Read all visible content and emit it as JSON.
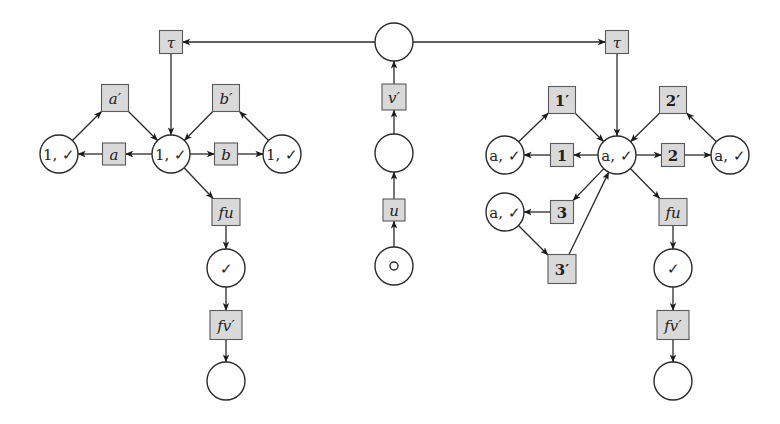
{
  "diagram": {
    "type": "petri-net",
    "colors": {
      "place_stroke": "#2a2a2a",
      "transition_fill": "#d9d9d9",
      "transition_stroke": "#5a5a5a",
      "background": "#ffffff"
    },
    "places": [
      {
        "id": "c_top",
        "x": 394,
        "y": 42,
        "label": ""
      },
      {
        "id": "c_mid",
        "x": 394,
        "y": 153,
        "label": ""
      },
      {
        "id": "c_start",
        "x": 394,
        "y": 266,
        "label": "",
        "token": true
      },
      {
        "id": "L_left",
        "x": 59,
        "y": 154,
        "label": "1, ✓"
      },
      {
        "id": "L_center",
        "x": 171,
        "y": 154,
        "label": "1, ✓"
      },
      {
        "id": "L_right",
        "x": 282,
        "y": 154,
        "label": "1, ✓"
      },
      {
        "id": "L_check",
        "x": 226,
        "y": 268,
        "label": "✓"
      },
      {
        "id": "L_end",
        "x": 226,
        "y": 381,
        "label": ""
      },
      {
        "id": "R_left",
        "x": 505,
        "y": 155,
        "label": "a, ✓"
      },
      {
        "id": "R_center",
        "x": 617,
        "y": 155,
        "label": "a, ✓"
      },
      {
        "id": "R_right",
        "x": 730,
        "y": 155,
        "label": "a, ✓"
      },
      {
        "id": "R_lower",
        "x": 505,
        "y": 212,
        "label": "a, ✓"
      },
      {
        "id": "R_check",
        "x": 673,
        "y": 268,
        "label": "✓"
      },
      {
        "id": "R_end",
        "x": 673,
        "y": 381,
        "label": ""
      }
    ],
    "transitions": [
      {
        "id": "t_u",
        "x": 394,
        "y": 210,
        "w": 22,
        "h": 22,
        "label": "u",
        "style": "it"
      },
      {
        "id": "t_vp",
        "x": 394,
        "y": 97,
        "w": 24,
        "h": 26,
        "label": "v′",
        "style": "it"
      },
      {
        "id": "L_tau",
        "x": 171,
        "y": 42,
        "w": 23,
        "h": 23,
        "label": "τ",
        "style": "it"
      },
      {
        "id": "L_ap",
        "x": 115,
        "y": 98,
        "w": 27,
        "h": 27,
        "label": "a′",
        "style": "it"
      },
      {
        "id": "L_a",
        "x": 114,
        "y": 154,
        "w": 23,
        "h": 22,
        "label": "a",
        "style": "it"
      },
      {
        "id": "L_bp",
        "x": 226,
        "y": 98,
        "w": 27,
        "h": 27,
        "label": "b′",
        "style": "it"
      },
      {
        "id": "L_b",
        "x": 226,
        "y": 154,
        "w": 23,
        "h": 22,
        "label": "b",
        "style": "it"
      },
      {
        "id": "L_fu",
        "x": 226,
        "y": 212,
        "w": 28,
        "h": 27,
        "label": "fu",
        "style": "it"
      },
      {
        "id": "L_fvp",
        "x": 226,
        "y": 325,
        "w": 32,
        "h": 29,
        "label": "fv′",
        "style": "it"
      },
      {
        "id": "R_tau",
        "x": 617,
        "y": 42,
        "w": 23,
        "h": 23,
        "label": "τ",
        "style": "it"
      },
      {
        "id": "R_1p",
        "x": 562,
        "y": 100,
        "w": 27,
        "h": 27,
        "label": "1′",
        "style": "num"
      },
      {
        "id": "R_1",
        "x": 562,
        "y": 155,
        "w": 23,
        "h": 23,
        "label": "1",
        "style": "num"
      },
      {
        "id": "R_2p",
        "x": 673,
        "y": 100,
        "w": 27,
        "h": 27,
        "label": "2′",
        "style": "num"
      },
      {
        "id": "R_2",
        "x": 673,
        "y": 155,
        "w": 23,
        "h": 23,
        "label": "2",
        "style": "num"
      },
      {
        "id": "R_3",
        "x": 562,
        "y": 212,
        "w": 23,
        "h": 23,
        "label": "3",
        "style": "num"
      },
      {
        "id": "R_3p",
        "x": 562,
        "y": 269,
        "w": 28,
        "h": 29,
        "label": "3′",
        "style": "num"
      },
      {
        "id": "R_fu",
        "x": 673,
        "y": 212,
        "w": 28,
        "h": 27,
        "label": "fu",
        "style": "it"
      },
      {
        "id": "R_fvp",
        "x": 673,
        "y": 325,
        "w": 32,
        "h": 29,
        "label": "fv′",
        "style": "it"
      }
    ],
    "arcs": [
      [
        "c_start",
        "t_u"
      ],
      [
        "t_u",
        "c_mid"
      ],
      [
        "c_mid",
        "t_vp"
      ],
      [
        "t_vp",
        "c_top"
      ],
      [
        "c_top",
        "L_tau"
      ],
      [
        "c_top",
        "R_tau"
      ],
      [
        "L_tau",
        "L_center"
      ],
      [
        "L_center",
        "L_a"
      ],
      [
        "L_a",
        "L_left"
      ],
      [
        "L_left",
        "L_ap"
      ],
      [
        "L_ap",
        "L_center"
      ],
      [
        "L_center",
        "L_b"
      ],
      [
        "L_b",
        "L_right"
      ],
      [
        "L_right",
        "L_bp"
      ],
      [
        "L_bp",
        "L_center"
      ],
      [
        "L_center",
        "L_fu"
      ],
      [
        "L_fu",
        "L_check"
      ],
      [
        "L_check",
        "L_fvp"
      ],
      [
        "L_fvp",
        "L_end"
      ],
      [
        "R_tau",
        "R_center"
      ],
      [
        "R_center",
        "R_1"
      ],
      [
        "R_1",
        "R_left"
      ],
      [
        "R_left",
        "R_1p"
      ],
      [
        "R_1p",
        "R_center"
      ],
      [
        "R_center",
        "R_2"
      ],
      [
        "R_2",
        "R_right"
      ],
      [
        "R_right",
        "R_2p"
      ],
      [
        "R_2p",
        "R_center"
      ],
      [
        "R_center",
        "R_3"
      ],
      [
        "R_3",
        "R_lower"
      ],
      [
        "R_lower",
        "R_3p"
      ],
      [
        "R_3p",
        "R_center"
      ],
      [
        "R_center",
        "R_fu"
      ],
      [
        "R_fu",
        "R_check"
      ],
      [
        "R_check",
        "R_fvp"
      ],
      [
        "R_fvp",
        "R_end"
      ]
    ],
    "place_radius": 19
  }
}
